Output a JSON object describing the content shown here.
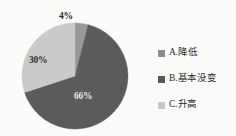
{
  "chart_data": {
    "type": "pie",
    "title": "",
    "categories": [
      "A.降低",
      "B.基本没变",
      "C.升高"
    ],
    "values": [
      4,
      66,
      30
    ],
    "value_labels": [
      "4%",
      "66%",
      "30%"
    ],
    "colors": [
      "#8d8d8d",
      "#595959",
      "#c9c9c9"
    ],
    "legend_position": "right",
    "grid": false,
    "start_angle_deg": 0,
    "direction": "clockwise",
    "slice_order": [
      "A.降低",
      "B.基本没变",
      "C.升高"
    ],
    "units": "percent"
  },
  "pie": {
    "center_x": 75,
    "center_y": 76,
    "radius": 53,
    "slices": [
      {
        "key": "a",
        "name": "A.降低",
        "value": 4,
        "label": "4%",
        "color": "#9a9a9a",
        "label_color": "#2b2b2b"
      },
      {
        "key": "b",
        "name": "B.基本没变",
        "value": 66,
        "label": "66%",
        "color": "#5c5c5c",
        "label_color": "#e8e8e8"
      },
      {
        "key": "c",
        "name": "C.升高",
        "value": 30,
        "label": "30%",
        "color": "#cbcbcb",
        "label_color": "#2e2e2e"
      }
    ]
  },
  "legend": {
    "items": [
      {
        "label": "A.降低",
        "color": "#8d8d8d"
      },
      {
        "label": "B.基本没变",
        "color": "#595959"
      },
      {
        "label": "C.升高",
        "color": "#c9c9c9"
      }
    ]
  },
  "background_color": "#fcfcfb"
}
